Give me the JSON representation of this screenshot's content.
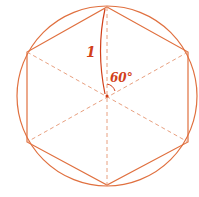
{
  "diagram": {
    "colors": {
      "stroke": "#e0703f",
      "dashed": "#e8a080",
      "label": "#d2401a",
      "background": "#ffffff"
    },
    "labels": {
      "side_length": "1",
      "angle": "60°"
    },
    "circle": {
      "cx": 107,
      "cy": 96,
      "r": 90
    },
    "hexagon_vertices": [
      [
        107,
        7
      ],
      [
        188,
        52
      ],
      [
        188,
        142
      ],
      [
        107,
        185
      ],
      [
        27,
        142
      ],
      [
        27,
        52
      ]
    ]
  }
}
